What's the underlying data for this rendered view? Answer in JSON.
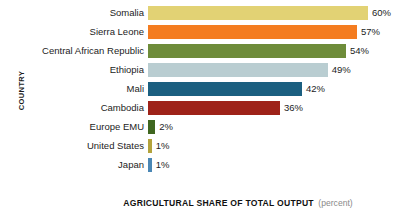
{
  "chart_data": {
    "type": "bar",
    "orientation": "horizontal",
    "title": "",
    "xlabel": "AGRICULTURAL SHARE OF TOTAL OUTPUT",
    "xlabel_unit": "(percent)",
    "ylabel": "COUNTRY",
    "grid": false,
    "legend": "none",
    "xlim": [
      0,
      60
    ],
    "value_suffix": "%",
    "categories": [
      "Somalia",
      "Sierra Leone",
      "Central African Republic",
      "Ethiopia",
      "Mali",
      "Cambodia",
      "Europe EMU",
      "United States",
      "Japan"
    ],
    "values": [
      60,
      57,
      54,
      49,
      42,
      36,
      2,
      1,
      1
    ],
    "value_labels": [
      "60%",
      "57%",
      "54%",
      "49%",
      "42%",
      "36%",
      "2%",
      "1%",
      "1%"
    ],
    "colors": [
      "#e2d274",
      "#f47c20",
      "#6e8c3a",
      "#b9cdd1",
      "#1b5f80",
      "#9e2219",
      "#3f661f",
      "#b3a33c",
      "#4a87b5"
    ],
    "bars": [
      {
        "category": "Somalia",
        "value": 60,
        "label": "60%",
        "color": "#e2d274"
      },
      {
        "category": "Sierra Leone",
        "value": 57,
        "label": "57%",
        "color": "#f47c20"
      },
      {
        "category": "Central African Republic",
        "value": 54,
        "label": "54%",
        "color": "#6e8c3a"
      },
      {
        "category": "Ethiopia",
        "value": 49,
        "label": "49%",
        "color": "#b9cdd1"
      },
      {
        "category": "Mali",
        "value": 42,
        "label": "42%",
        "color": "#1b5f80"
      },
      {
        "category": "Cambodia",
        "value": 36,
        "label": "36%",
        "color": "#9e2219"
      },
      {
        "category": "Europe EMU",
        "value": 2,
        "label": "2%",
        "color": "#3f661f"
      },
      {
        "category": "United States",
        "value": 1,
        "label": "1%",
        "color": "#b3a33c"
      },
      {
        "category": "Japan",
        "value": 1,
        "label": "1%",
        "color": "#4a87b5"
      }
    ]
  }
}
